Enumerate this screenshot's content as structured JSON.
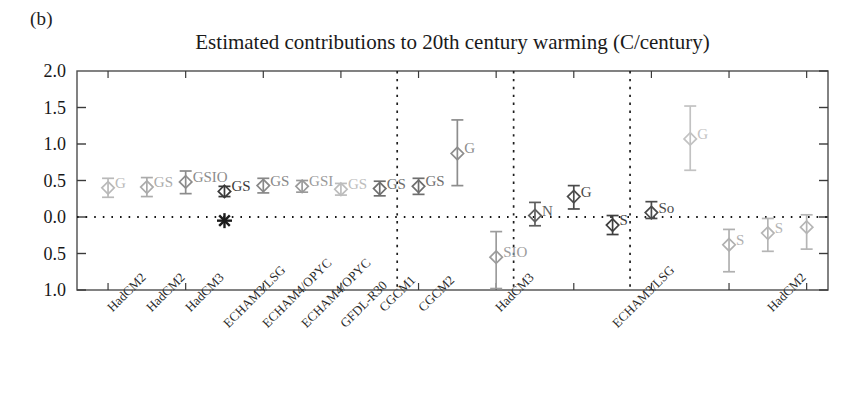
{
  "panel": {
    "label": "(b)"
  },
  "chart_data": {
    "type": "scatter",
    "title": "Estimated contributions to 20th century warming (C/century)",
    "xlabel": "",
    "ylabel": "",
    "ylim": [
      -1.0,
      2.0
    ],
    "yticks": [
      2.0,
      1.5,
      1.0,
      0.5,
      0.0,
      -0.5,
      -1.0
    ],
    "ytick_labels": [
      "2.0",
      "1.5",
      "1.0",
      "0.5",
      "0.0",
      "0.5",
      "1.0"
    ],
    "grid": false,
    "zero_line": true,
    "legend": "none",
    "group_separators_after": [
      8,
      11,
      14
    ],
    "categories": [
      "HadCM2",
      "HadCM2",
      "HadCM3",
      "ECHAM3/LSG",
      "ECHAM4/OPYC",
      "ECHAM4/OPYC",
      "GFDL-R30",
      "CGCM1",
      "CGCM2",
      "HadCM3",
      "ECHAM3/LSG",
      "HadCM2"
    ],
    "points": [
      {
        "category": "HadCM2",
        "annotation": "G",
        "value": 0.4,
        "err_low": 0.27,
        "err_high": 0.53,
        "color": "#b9b9b9",
        "group": 1
      },
      {
        "category": "HadCM2",
        "annotation": "GS",
        "value": 0.41,
        "err_low": 0.28,
        "err_high": 0.54,
        "color": "#ababab",
        "group": 1
      },
      {
        "category": "HadCM3",
        "annotation": "GSIO",
        "value": 0.48,
        "err_low": 0.32,
        "err_high": 0.63,
        "color": "#8c8c8c",
        "group": 1
      },
      {
        "category": "ECHAM3/LSG",
        "annotation": "GS",
        "value": 0.35,
        "err_low": 0.28,
        "err_high": 0.42,
        "color": "#3a3a3a",
        "group": 1
      },
      {
        "category": "ECHAM4/OPYC",
        "annotation": "GS",
        "value": 0.43,
        "err_low": 0.33,
        "err_high": 0.53,
        "color": "#888888",
        "group": 1
      },
      {
        "category": "ECHAM4/OPYC",
        "annotation": "GSI",
        "value": 0.42,
        "err_low": 0.34,
        "err_high": 0.5,
        "color": "#9a9a9a",
        "group": 1
      },
      {
        "category": "GFDL-R30",
        "annotation": "GS",
        "value": 0.38,
        "err_low": 0.3,
        "err_high": 0.46,
        "color": "#bdbdbd",
        "group": 1
      },
      {
        "category": "CGCM1",
        "annotation": "GS",
        "value": 0.39,
        "err_low": 0.29,
        "err_high": 0.49,
        "color": "#6e6e6e",
        "group": 1
      },
      {
        "category": "CGCM2",
        "annotation": "GS",
        "value": 0.42,
        "err_low": 0.31,
        "err_high": 0.53,
        "color": "#6e6e6e",
        "group": 1
      },
      {
        "category": "HadCM3",
        "annotation": "G",
        "value": 0.87,
        "err_low": 0.43,
        "err_high": 1.33,
        "color": "#8d8d8d",
        "group": 2
      },
      {
        "category": "HadCM3",
        "annotation": "SIO",
        "value": -0.55,
        "err_low": -0.98,
        "err_high": -0.2,
        "color": "#9c9c9c",
        "group": 2
      },
      {
        "category": "HadCM3",
        "annotation": "N",
        "value": 0.02,
        "err_low": -0.12,
        "err_high": 0.2,
        "color": "#5f5f5f",
        "group": 2
      },
      {
        "category": "ECHAM3/LSG",
        "annotation": "G",
        "value": 0.28,
        "err_low": 0.11,
        "err_high": 0.43,
        "color": "#4b4b4b",
        "group": 3
      },
      {
        "category": "ECHAM3/LSG",
        "annotation": "S",
        "value": -0.11,
        "err_low": -0.24,
        "err_high": 0.02,
        "color": "#3f3f3f",
        "group": 3
      },
      {
        "category": "ECHAM3/LSG",
        "annotation": "So",
        "value": 0.06,
        "err_low": -0.02,
        "err_high": 0.21,
        "color": "#4a4a4a",
        "group": 3
      },
      {
        "category": "HadCM2",
        "annotation": "G",
        "value": 1.07,
        "err_low": 0.64,
        "err_high": 1.52,
        "color": "#c2c2c2",
        "group": 4
      },
      {
        "category": "HadCM2",
        "annotation": "S",
        "value": -0.38,
        "err_low": -0.75,
        "err_high": -0.17,
        "color": "#b0b0b0",
        "group": 4
      },
      {
        "category": "HadCM2",
        "annotation": "S",
        "value": -0.22,
        "err_low": -0.47,
        "err_high": -0.02,
        "color": "#b5b5b5",
        "group": 4
      },
      {
        "category": "HadCM2",
        "annotation": "",
        "value": -0.14,
        "err_low": -0.44,
        "err_high": 0.03,
        "color": "#b5b5b5",
        "group": 4
      }
    ],
    "special_marker": {
      "symbol": "asterisk",
      "value": -0.05,
      "category_index": 3,
      "color": "#1c1c1c"
    }
  }
}
